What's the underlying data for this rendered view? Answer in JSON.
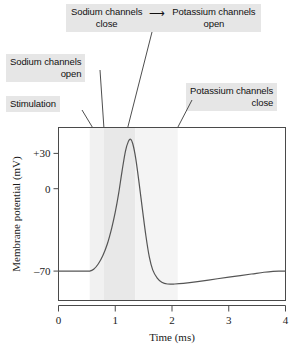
{
  "callouts": {
    "sodium_close": {
      "line1": "Sodium channels",
      "line2": "close"
    },
    "arrow_glyph": "⟶",
    "potassium_open": {
      "line1": "Potassium channels",
      "line2": "open"
    },
    "sodium_open": {
      "line1": "Sodium channels",
      "line2": "open"
    },
    "stimulation": {
      "line1": "Stimulation"
    },
    "potassium_close": {
      "line1": "Potassium channels",
      "line2": "close"
    }
  },
  "chart_data": {
    "type": "line",
    "title": "",
    "xlabel": "Time (ms)",
    "ylabel": "Membrane potential (mV)",
    "xlim": [
      0,
      4
    ],
    "ylim": [
      -95,
      52
    ],
    "xticks": [
      0,
      1,
      2,
      3,
      4
    ],
    "xtick_labels": [
      "0",
      "1",
      "2",
      "3",
      "4"
    ],
    "yticks": [
      30,
      0,
      -70
    ],
    "ytick_labels": [
      "+30",
      "0",
      "–70"
    ],
    "grid": false,
    "legend": false,
    "resting_potential": -70,
    "peak_potential": 42,
    "hyperpolarization_min": -81,
    "series": [
      {
        "name": "Membrane potential",
        "color": "#555555",
        "x": [
          0.0,
          0.2,
          0.4,
          0.55,
          0.62,
          0.7,
          0.78,
          0.86,
          0.94,
          1.0,
          1.06,
          1.12,
          1.18,
          1.23,
          1.27,
          1.31,
          1.36,
          1.42,
          1.48,
          1.54,
          1.6,
          1.66,
          1.74,
          1.82,
          1.92,
          2.05,
          2.2,
          2.45,
          2.8,
          3.1,
          3.4,
          3.62,
          3.78,
          3.9,
          4.0
        ],
        "y": [
          -70,
          -70,
          -70,
          -70,
          -68.5,
          -64,
          -57,
          -47,
          -33,
          -20,
          -4,
          15,
          32,
          40,
          42,
          38,
          26,
          5,
          -18,
          -40,
          -58,
          -69,
          -76,
          -79.5,
          -81,
          -81,
          -80.5,
          -79,
          -76.5,
          -74.5,
          -72.5,
          -71,
          -70.2,
          -70,
          -70
        ]
      }
    ],
    "shaded_regions": [
      {
        "name": "sodium-permeability-band",
        "x0": 0.55,
        "x1": 0.8,
        "color": "#f1f1f1"
      },
      {
        "name": "peak-permeability-band",
        "x0": 0.8,
        "x1": 1.35,
        "color": "#e8e8e8"
      },
      {
        "name": "potassium-permeability-band",
        "x0": 1.35,
        "x1": 2.1,
        "color": "#f4f4f4"
      }
    ],
    "leader_lines": [
      {
        "name": "stimulation-leader",
        "x": 0.6,
        "from_px": [
          82,
          110
        ]
      },
      {
        "name": "sodium-open-leader",
        "x": 0.8,
        "from_px": [
          100,
          70
        ]
      },
      {
        "name": "sodium-close-leader",
        "x": 1.22,
        "from_px": [
          152,
          32
        ]
      },
      {
        "name": "potassium-close-leader",
        "x": 2.1,
        "from_px": [
          192,
          100
        ]
      }
    ]
  }
}
